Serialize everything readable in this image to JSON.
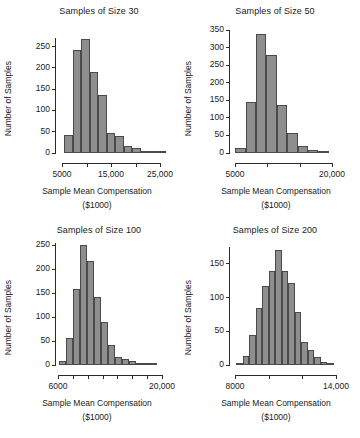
{
  "figure": {
    "layout": "2x2 grid of histograms",
    "shared_ylabel": "Number of Samples",
    "shared_xlabel_line1": "Sample Mean Compensation",
    "shared_xlabel_line2": "($1000)",
    "bar_color": "#8e8e8e",
    "bar_border_color": "#4a4a4a",
    "axis_color": "#2b2b2b",
    "background": "#ffffff"
  },
  "chart_data": [
    {
      "type": "bar",
      "title": "Samples of Size 30",
      "xlabel": "Sample Mean Compensation ($1000)",
      "ylabel": "Number of Samples",
      "ylim": [
        0,
        270
      ],
      "yticks": [
        0,
        50,
        100,
        150,
        200,
        250
      ],
      "xlim": [
        3000,
        29000
      ],
      "xticks": [
        5000,
        10000,
        15000,
        20000,
        25000
      ],
      "xticklabels": [
        "5000",
        "",
        "15,000",
        "",
        "25,000"
      ],
      "bin_width": 2000,
      "bin_starts": [
        5000,
        7000,
        9000,
        11000,
        13000,
        15000,
        17000,
        19000,
        21000,
        23000,
        25000,
        27000
      ],
      "values": [
        42,
        241,
        268,
        190,
        136,
        48,
        41,
        17,
        12,
        4,
        2,
        2
      ],
      "grid": false,
      "legend": false
    },
    {
      "type": "bar",
      "title": "Samples of Size 50",
      "xlabel": "Sample Mean Compensation ($1000)",
      "ylabel": "Number of Samples",
      "ylim": [
        0,
        350
      ],
      "yticks": [
        0,
        50,
        100,
        150,
        200,
        250,
        300,
        350
      ],
      "xlim": [
        4000,
        24000
      ],
      "xticks": [
        5000,
        10000,
        15000,
        20000
      ],
      "xticklabels": [
        "5000",
        "",
        "",
        "20,000"
      ],
      "bin_width": 2000,
      "bin_starts": [
        5000,
        7000,
        9000,
        11000,
        13000,
        15000,
        17000,
        19000,
        21000
      ],
      "values": [
        14,
        146,
        340,
        278,
        136,
        58,
        20,
        8,
        3
      ],
      "grid": false,
      "legend": false
    },
    {
      "type": "bar",
      "title": "Samples of Size 100",
      "xlabel": "Sample Mean Compensation ($1000)",
      "ylabel": "Number of Samples",
      "ylim": [
        0,
        255
      ],
      "yticks": [
        0,
        50,
        100,
        150,
        200,
        250
      ],
      "xlim": [
        5500,
        21000
      ],
      "xticks": [
        6000,
        8000,
        10000,
        12000,
        14000,
        16000,
        18000,
        20000
      ],
      "xticklabels": [
        "6000",
        "",
        "",
        "",
        "",
        "",
        "",
        "20,000"
      ],
      "bin_width": 1000,
      "bin_starts": [
        6000,
        7000,
        8000,
        9000,
        10000,
        11000,
        12000,
        13000,
        14000,
        15000,
        16000,
        17000,
        18000,
        19000
      ],
      "values": [
        8,
        56,
        159,
        250,
        217,
        143,
        89,
        41,
        16,
        12,
        8,
        1,
        1,
        2
      ],
      "grid": false,
      "legend": false
    },
    {
      "type": "bar",
      "title": "Samples of Size 200",
      "xlabel": "Sample Mean Compensation ($1000)",
      "ylabel": "Number of Samples",
      "ylim": [
        0,
        175
      ],
      "yticks": [
        0,
        50,
        100,
        150
      ],
      "xlim": [
        7000,
        15500
      ],
      "xticks": [
        8000,
        10000,
        12000,
        14000
      ],
      "xticklabels": [
        "8000",
        "",
        "",
        "14,000"
      ],
      "bin_width": 500,
      "bin_starts": [
        7500,
        8000,
        8500,
        9000,
        9500,
        10000,
        10500,
        11000,
        11500,
        12000,
        12500,
        13000,
        13500,
        14000,
        14500
      ],
      "values": [
        3,
        13,
        44,
        84,
        117,
        140,
        171,
        140,
        122,
        78,
        34,
        22,
        12,
        5,
        3
      ],
      "grid": false,
      "legend": false
    }
  ]
}
